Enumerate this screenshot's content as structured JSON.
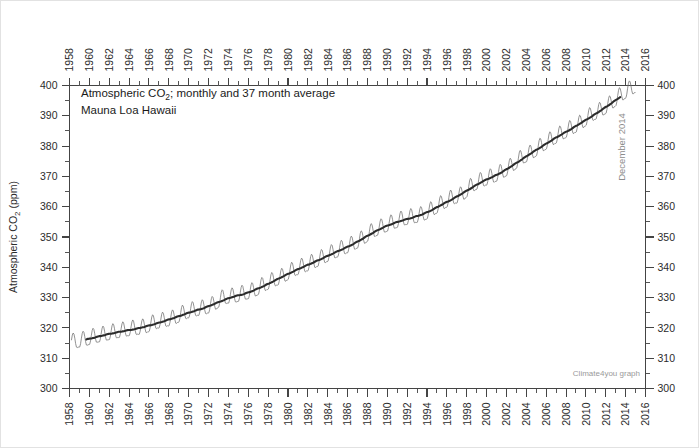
{
  "figure": {
    "watermark": "Climate4you graph",
    "annotation_title": "Atmospheric CO",
    "annotation_title_sub": "2",
    "annotation_title_rest": "; monthly and 37 month average",
    "annotation_subtitle": "Mauna Loa Hawaii",
    "end_date_label": "December 2014",
    "colors": {
      "monthly_series": "#6e6e6e",
      "smooth_series": "#2b2b2b",
      "axis": "#444444",
      "background": "#ffffff",
      "watermark": "#9a9a9a",
      "annotation_gray": "#8d8d8d"
    }
  },
  "chart_data": {
    "type": "line",
    "title": "Atmospheric CO2; monthly and 37 month average",
    "subtitle": "Mauna Loa Hawaii",
    "xlabel": "",
    "ylabel": "Atmospheric CO2 (ppm)",
    "ylim": [
      300,
      400
    ],
    "xlim": [
      1958,
      2016
    ],
    "grid": false,
    "legend_position": "none",
    "y_ticks_major": [
      300,
      310,
      320,
      330,
      340,
      350,
      360,
      370,
      380,
      390,
      400
    ],
    "y_ticks_minor_step": 5,
    "x_ticks_major": [
      1958,
      1960,
      1962,
      1964,
      1966,
      1968,
      1970,
      1972,
      1974,
      1976,
      1978,
      1980,
      1982,
      1984,
      1986,
      1988,
      1990,
      1992,
      1994,
      1996,
      1998,
      2000,
      2002,
      2004,
      2006,
      2008,
      2010,
      2012,
      2014,
      2016
    ],
    "x_ticks_minor_step": 1,
    "axes_mirrored": true,
    "seasonal_amplitude_ppm": 3.1,
    "series": [
      {
        "name": "monthly",
        "style": "thin-gray",
        "note": "monthly mean CO2, sawtooth seasonal cycle"
      },
      {
        "name": "37 month average",
        "style": "thick-black",
        "note": "37 month running mean trend"
      }
    ],
    "annual_mean_x": [
      1958.5,
      1959.5,
      1960.5,
      1961.5,
      1962.5,
      1963.5,
      1964.5,
      1965.5,
      1966.5,
      1967.5,
      1968.5,
      1969.5,
      1970.5,
      1971.5,
      1972.5,
      1973.5,
      1974.5,
      1975.5,
      1976.5,
      1977.5,
      1978.5,
      1979.5,
      1980.5,
      1981.5,
      1982.5,
      1983.5,
      1984.5,
      1985.5,
      1986.5,
      1987.5,
      1988.5,
      1989.5,
      1990.5,
      1991.5,
      1992.5,
      1993.5,
      1994.5,
      1995.5,
      1996.5,
      1997.5,
      1998.5,
      1999.5,
      2000.5,
      2001.5,
      2002.5,
      2003.5,
      2004.5,
      2005.5,
      2006.5,
      2007.5,
      2008.5,
      2009.5,
      2010.5,
      2011.5,
      2012.5,
      2013.5,
      2014.5
    ],
    "annual_mean_y": [
      315.3,
      315.9,
      316.9,
      317.6,
      318.4,
      319.0,
      319.6,
      320.0,
      321.4,
      322.2,
      323.0,
      324.6,
      325.7,
      326.3,
      327.5,
      329.7,
      330.2,
      331.1,
      332.0,
      333.8,
      335.4,
      336.8,
      338.8,
      340.1,
      341.4,
      343.0,
      344.6,
      346.0,
      347.4,
      349.2,
      351.6,
      353.1,
      354.4,
      355.6,
      356.4,
      357.1,
      358.8,
      360.8,
      362.6,
      363.7,
      366.6,
      368.4,
      369.6,
      371.1,
      373.2,
      375.8,
      377.5,
      379.8,
      381.9,
      383.8,
      385.6,
      387.4,
      389.9,
      391.6,
      393.8,
      396.5,
      398.6
    ],
    "start_value_ppm": 315.3,
    "end_value_ppm": 398.6,
    "peak_monthly_ppm": 402.0,
    "min_monthly_ppm": 312.9
  },
  "axes": {
    "y_left_title": "Atmospheric CO2 (ppm)",
    "y_left_title_parts": {
      "before": "Atmospheric CO",
      "sub": "2",
      "after": " (ppm)"
    }
  }
}
